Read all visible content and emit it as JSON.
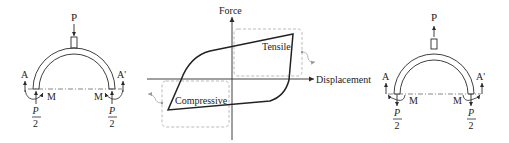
{
  "left_structure": {
    "load_label": "P",
    "load_direction": "down",
    "support_left_label": "A",
    "support_right_label": "A'",
    "moment_left_label": "M",
    "moment_right_label": "M",
    "reaction_left": {
      "numerator": "P",
      "denominator": "2",
      "direction": "up"
    },
    "reaction_right": {
      "numerator": "P",
      "denominator": "2",
      "direction": "up"
    }
  },
  "chart": {
    "y_axis_label": "Force",
    "x_axis_label": "Displacement",
    "tensile_label": "Tensile",
    "compressive_label": "Compressive"
  },
  "right_structure": {
    "load_label": "P",
    "load_direction": "up",
    "support_left_label": "A",
    "support_right_label": "A'",
    "moment_left_label": "M",
    "moment_right_label": "M",
    "reaction_left": {
      "numerator": "P",
      "denominator": "2",
      "direction": "down"
    },
    "reaction_right": {
      "numerator": "P",
      "denominator": "2",
      "direction": "down"
    }
  },
  "colors": {
    "line": "#2a2a2a",
    "dashed_box": "#aaaaaa",
    "loop": "#222222"
  }
}
